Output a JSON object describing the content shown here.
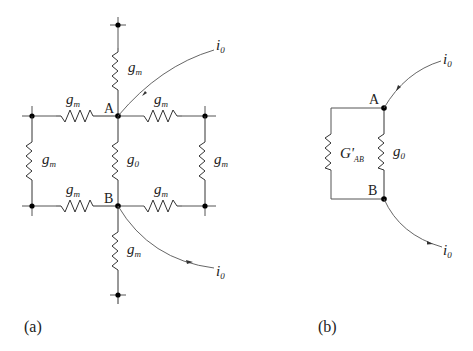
{
  "panel_a": {
    "caption": "(a)",
    "node_labels": {
      "A": "A",
      "B": "B"
    },
    "resistors": {
      "top": {
        "symbol": "g",
        "sub": "m"
      },
      "left_top": {
        "symbol": "g",
        "sub": "m"
      },
      "right_top": {
        "symbol": "g",
        "sub": "m"
      },
      "center": {
        "symbol": "g",
        "sub": "0"
      },
      "left_vertical": {
        "symbol": "g",
        "sub": "m"
      },
      "right_vertical": {
        "symbol": "g",
        "sub": "m"
      },
      "left_bottom": {
        "symbol": "g",
        "sub": "m"
      },
      "right_bottom": {
        "symbol": "g",
        "sub": "m"
      },
      "bottom": {
        "symbol": "g",
        "sub": "m"
      }
    },
    "currents": {
      "in": {
        "symbol": "i",
        "sub": "0"
      },
      "out": {
        "symbol": "i",
        "sub": "0"
      }
    }
  },
  "panel_b": {
    "caption": "(b)",
    "node_labels": {
      "A": "A",
      "B": "B"
    },
    "resistors": {
      "equivalent": {
        "symbol": "G'",
        "sub": "AB"
      },
      "center": {
        "symbol": "g",
        "sub": "0"
      }
    },
    "currents": {
      "in": {
        "symbol": "i",
        "sub": "0"
      },
      "out": {
        "symbol": "i",
        "sub": "0"
      }
    }
  }
}
